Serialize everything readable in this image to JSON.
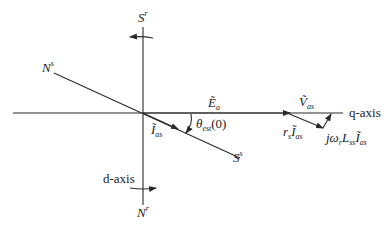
{
  "diagram": {
    "type": "phasor-diagram",
    "background": "#ffffff",
    "stroke_color": "#2a2a2a",
    "labels": {
      "stator_S_top": {
        "base": "S",
        "sup": "r"
      },
      "stator_N_left": {
        "base": "N",
        "sup": "s"
      },
      "stator_S_right": {
        "base": "S",
        "sup": "s"
      },
      "rotor_N_bottom": {
        "base": "N",
        "sup": "r"
      },
      "back_emf": {
        "base": "Ẽ",
        "sub": "a"
      },
      "voltage": {
        "base": "Ṽ",
        "sub": "as"
      },
      "current": {
        "base": "Ĩ",
        "sub": "as"
      },
      "angle": {
        "base": "θ",
        "sub": "est",
        "suffix": "(0)"
      },
      "resistive_drop": {
        "prefix": "r",
        "prefix_sub": "s",
        "base": "Ĩ",
        "sub": "as"
      },
      "inductive_drop": {
        "prefix": "jω",
        "prefix_sub": "r",
        "mid": "L",
        "mid_sub": "ss",
        "base": "Ĩ",
        "sub": "as"
      },
      "q_axis": "q-axis",
      "d_axis": "d-axis"
    }
  }
}
